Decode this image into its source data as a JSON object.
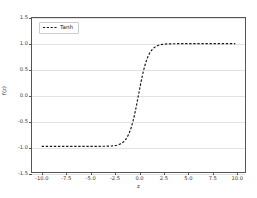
{
  "chart_data": {
    "type": "line",
    "title": "",
    "xlabel": "z",
    "ylabel": "f(z)",
    "xlim": [
      -11.0,
      11.0
    ],
    "ylim": [
      -1.5,
      1.5
    ],
    "grid": true,
    "grid_axis": "y",
    "legend": {
      "position": "upper left",
      "entries": [
        {
          "name": "Tanh",
          "color": "#1a1a1a",
          "linestyle": "dashed"
        }
      ]
    },
    "xticks": [
      -10.0,
      -7.5,
      -5.0,
      -2.5,
      0.0,
      2.5,
      5.0,
      7.5,
      10.0
    ],
    "xtick_labels": [
      "-10.0",
      "-7.5",
      "-5.0",
      "-2.5",
      "0.0",
      "2.5",
      "5.0",
      "7.5",
      "10.0"
    ],
    "yticks": [
      -1.5,
      -1.0,
      -0.5,
      0.0,
      0.5,
      1.0,
      1.5
    ],
    "ytick_labels": [
      "-1.5",
      "-1.0",
      "-0.5",
      "0.0",
      "0.5",
      "1.0",
      "1.5"
    ],
    "series": [
      {
        "name": "Tanh",
        "color": "#1a1a1a",
        "linestyle": "dashed",
        "linewidth": 1.2,
        "x": [
          -10.0,
          -9.5,
          -9.0,
          -8.5,
          -8.0,
          -7.5,
          -7.0,
          -6.5,
          -6.0,
          -5.5,
          -5.0,
          -4.5,
          -4.0,
          -3.5,
          -3.0,
          -2.75,
          -2.5,
          -2.25,
          -2.0,
          -1.75,
          -1.5,
          -1.25,
          -1.0,
          -0.75,
          -0.5,
          -0.25,
          0.0,
          0.25,
          0.5,
          0.75,
          1.0,
          1.25,
          1.5,
          1.75,
          2.0,
          2.25,
          2.5,
          2.75,
          3.0,
          3.5,
          4.0,
          4.5,
          5.0,
          5.5,
          6.0,
          6.5,
          7.0,
          7.5,
          8.0,
          8.5,
          9.0,
          9.5,
          10.0
        ],
        "y": [
          -1.0,
          -1.0,
          -1.0,
          -1.0,
          -1.0,
          -1.0,
          -1.0,
          -1.0,
          -1.0,
          -1.0,
          -0.9999,
          -0.9998,
          -0.9993,
          -0.9982,
          -0.9951,
          -0.9919,
          -0.9866,
          -0.978,
          -0.964,
          -0.9414,
          -0.9051,
          -0.8483,
          -0.7616,
          -0.6351,
          -0.4621,
          -0.2449,
          0.0,
          0.2449,
          0.4621,
          0.6351,
          0.7616,
          0.8483,
          0.9051,
          0.9414,
          0.964,
          0.978,
          0.9866,
          0.9919,
          0.9951,
          0.9982,
          0.9993,
          0.9998,
          0.9999,
          1.0,
          1.0,
          1.0,
          1.0,
          1.0,
          1.0,
          1.0,
          1.0,
          1.0,
          1.0
        ]
      }
    ]
  },
  "style": {
    "background": "#ffffff",
    "spine_color": "#555555",
    "grid_color": "#e2e2e2",
    "tick_label_color": "#3a3a3a",
    "curve_color": "#1a1a1a"
  }
}
